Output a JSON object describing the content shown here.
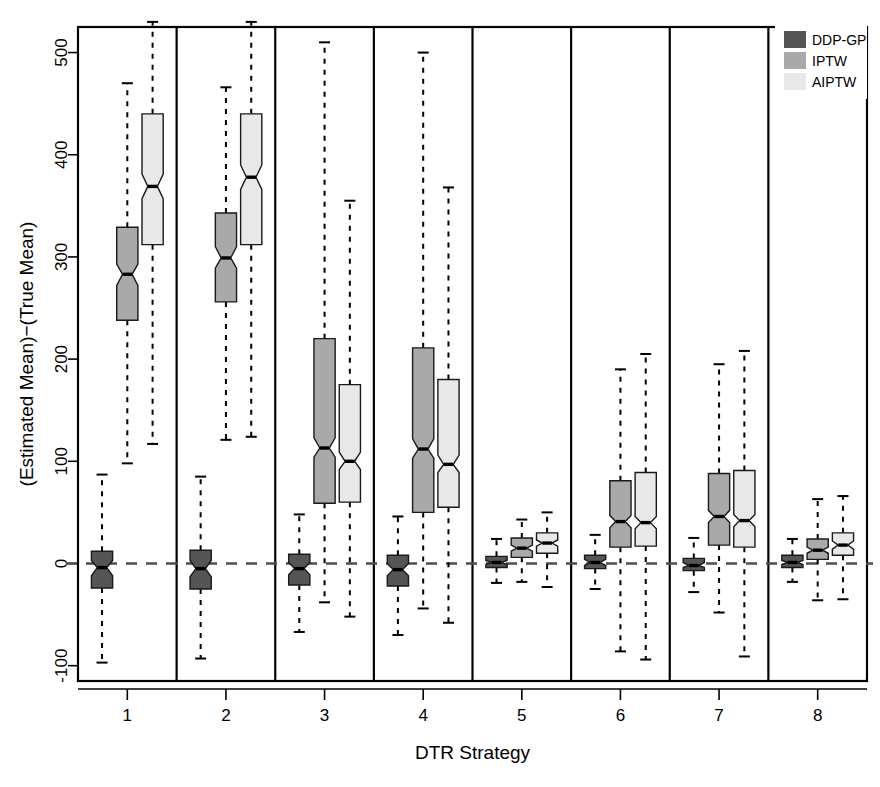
{
  "chart_data": {
    "type": "box",
    "title": "",
    "xlabel": "DTR Strategy",
    "ylabel": "(Estimated Mean)−(True Mean)",
    "ylim": [
      -115,
      525
    ],
    "yticks": [
      -100,
      0,
      100,
      200,
      300,
      400,
      500
    ],
    "ytick_labels": [
      "-100",
      "0",
      "100",
      "200",
      "300",
      "400",
      "500"
    ],
    "categories": [
      "1",
      "2",
      "3",
      "4",
      "5",
      "6",
      "7",
      "8"
    ],
    "grid": false,
    "notched": true,
    "reference_line": 0,
    "reference_line_style": "dashed",
    "legend_position": "top-right",
    "legend": [
      {
        "name": "DDP-GP",
        "color": "#555555"
      },
      {
        "name": "IPTW",
        "color": "#a9a9a9"
      },
      {
        "name": "AIPTW",
        "color": "#e8e8e8"
      }
    ],
    "series": [
      {
        "name": "DDP-GP",
        "color": "#555555",
        "boxes": [
          {
            "category": "1",
            "lower_whisker": -97,
            "q1": -24,
            "median": -4,
            "q3": 12,
            "upper_whisker": 87,
            "notch_lower": -12,
            "notch_upper": 3
          },
          {
            "category": "2",
            "lower_whisker": -93,
            "q1": -25,
            "median": -5,
            "q3": 13,
            "upper_whisker": 85,
            "notch_lower": -13,
            "notch_upper": 3
          },
          {
            "category": "3",
            "lower_whisker": -67,
            "q1": -21,
            "median": -5,
            "q3": 9,
            "upper_whisker": 48,
            "notch_lower": -11,
            "notch_upper": 1
          },
          {
            "category": "4",
            "lower_whisker": -70,
            "q1": -22,
            "median": -6,
            "q3": 8,
            "upper_whisker": 46,
            "notch_lower": -12,
            "notch_upper": 0
          },
          {
            "category": "5",
            "lower_whisker": -19,
            "q1": -4,
            "median": 1,
            "q3": 7,
            "upper_whisker": 24,
            "notch_lower": -1,
            "notch_upper": 3
          },
          {
            "category": "6",
            "lower_whisker": -25,
            "q1": -5,
            "median": 1,
            "q3": 8,
            "upper_whisker": 28,
            "notch_lower": -2,
            "notch_upper": 4
          },
          {
            "category": "7",
            "lower_whisker": -28,
            "q1": -7,
            "median": -2,
            "q3": 5,
            "upper_whisker": 25,
            "notch_lower": -4,
            "notch_upper": 1
          },
          {
            "category": "8",
            "lower_whisker": -18,
            "q1": -4,
            "median": 1,
            "q3": 8,
            "upper_whisker": 24,
            "notch_lower": -1,
            "notch_upper": 3
          }
        ]
      },
      {
        "name": "IPTW",
        "color": "#a9a9a9",
        "boxes": [
          {
            "category": "1",
            "lower_whisker": 98,
            "q1": 238,
            "median": 283,
            "q3": 329,
            "upper_whisker": 470,
            "notch_lower": 272,
            "notch_upper": 293
          },
          {
            "category": "2",
            "lower_whisker": 121,
            "q1": 256,
            "median": 299,
            "q3": 343,
            "upper_whisker": 466,
            "notch_lower": 289,
            "notch_upper": 310
          },
          {
            "category": "3",
            "lower_whisker": -38,
            "q1": 59,
            "median": 113,
            "q3": 220,
            "upper_whisker": 510,
            "notch_lower": 104,
            "notch_upper": 123
          },
          {
            "category": "4",
            "lower_whisker": -44,
            "q1": 50,
            "median": 112,
            "q3": 211,
            "upper_whisker": 500,
            "notch_lower": 103,
            "notch_upper": 122
          },
          {
            "category": "5",
            "lower_whisker": -18,
            "q1": 6,
            "median": 15,
            "q3": 25,
            "upper_whisker": 43,
            "notch_lower": 12,
            "notch_upper": 18
          },
          {
            "category": "6",
            "lower_whisker": -86,
            "q1": 16,
            "median": 41,
            "q3": 81,
            "upper_whisker": 190,
            "notch_lower": 35,
            "notch_upper": 47
          },
          {
            "category": "7",
            "lower_whisker": -48,
            "q1": 18,
            "median": 46,
            "q3": 88,
            "upper_whisker": 195,
            "notch_lower": 40,
            "notch_upper": 52
          },
          {
            "category": "8",
            "lower_whisker": -36,
            "q1": 4,
            "median": 13,
            "q3": 24,
            "upper_whisker": 63,
            "notch_lower": 10,
            "notch_upper": 16
          }
        ]
      },
      {
        "name": "AIPTW",
        "color": "#e8e8e8",
        "boxes": [
          {
            "category": "1",
            "lower_whisker": 117,
            "q1": 312,
            "median": 369,
            "q3": 440,
            "upper_whisker": 530,
            "notch_lower": 357,
            "notch_upper": 381
          },
          {
            "category": "2",
            "lower_whisker": 124,
            "q1": 312,
            "median": 378,
            "q3": 440,
            "upper_whisker": 530,
            "notch_lower": 366,
            "notch_upper": 390
          },
          {
            "category": "3",
            "lower_whisker": -52,
            "q1": 60,
            "median": 100,
            "q3": 175,
            "upper_whisker": 355,
            "notch_lower": 92,
            "notch_upper": 109
          },
          {
            "category": "4",
            "lower_whisker": -58,
            "q1": 55,
            "median": 97,
            "q3": 180,
            "upper_whisker": 368,
            "notch_lower": 89,
            "notch_upper": 106
          },
          {
            "category": "5",
            "lower_whisker": -23,
            "q1": 10,
            "median": 20,
            "q3": 30,
            "upper_whisker": 50,
            "notch_lower": 17,
            "notch_upper": 23
          },
          {
            "category": "6",
            "lower_whisker": -94,
            "q1": 17,
            "median": 40,
            "q3": 89,
            "upper_whisker": 205,
            "notch_lower": 34,
            "notch_upper": 46
          },
          {
            "category": "7",
            "lower_whisker": -91,
            "q1": 16,
            "median": 42,
            "q3": 91,
            "upper_whisker": 208,
            "notch_lower": 36,
            "notch_upper": 48
          },
          {
            "category": "8",
            "lower_whisker": -35,
            "q1": 8,
            "median": 18,
            "q3": 30,
            "upper_whisker": 66,
            "notch_lower": 14,
            "notch_upper": 22
          }
        ]
      }
    ]
  }
}
